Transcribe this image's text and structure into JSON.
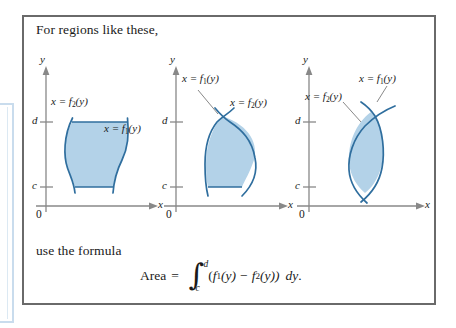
{
  "panel": {
    "caption_top": "For regions like these,",
    "caption_mid": "use the formula"
  },
  "formula": {
    "area_word": "Area",
    "equals": "=",
    "integral_sign": "∫",
    "upper_limit": "d",
    "lower_limit": "c",
    "open_paren": "(",
    "f1": "f",
    "f1_sub": "1",
    "f1_arg": "(y)",
    "minus": "−",
    "f2": "f",
    "f2_sub": "2",
    "f2_arg": "(y))",
    "differential": "dy",
    "period": "."
  },
  "figures": [
    {
      "id": "figure-1",
      "y_axis_label": "y",
      "x_axis_label": "x",
      "origin_label": "0",
      "tick_d": "d",
      "tick_c": "c",
      "label_left": "x = f",
      "label_left_sub": "2",
      "label_left_arg": "(y)",
      "label_right": "x = f",
      "label_right_sub": "1",
      "label_right_arg": "(y)"
    },
    {
      "id": "figure-2",
      "y_axis_label": "y",
      "x_axis_label": "x",
      "origin_label": "0",
      "tick_d": "d",
      "tick_c": "c",
      "label_left": "x = f",
      "label_left_sub": "1",
      "label_left_arg": "(y)",
      "label_right": "x = f",
      "label_right_sub": "2",
      "label_right_arg": "(y)"
    },
    {
      "id": "figure-3",
      "y_axis_label": "y",
      "x_axis_label": "x",
      "origin_label": "0",
      "tick_d": "d",
      "tick_c": "c",
      "label_left": "x = f",
      "label_left_sub": "2",
      "label_left_arg": "(y)",
      "label_right": "x = f",
      "label_right_sub": "1",
      "label_right_arg": "(y)"
    }
  ],
  "colors": {
    "region_fill": "#b3d2e8",
    "curve_stroke": "#2f6e9e",
    "axis_stroke": "#888888",
    "frame_border": "#6a6a6a",
    "bleed_border": "#c9dced",
    "text": "#1a1a1a"
  }
}
